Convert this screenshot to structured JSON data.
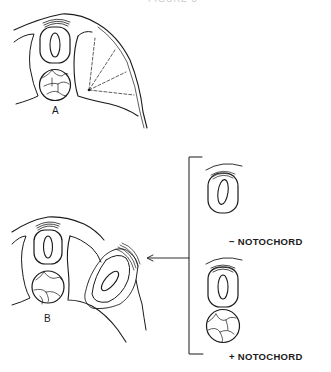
{
  "figure": {
    "title_partial": "FIGURE 3",
    "panels": [
      {
        "id": "A",
        "label": "A",
        "description": "Cross-section: neural tube above notochord, with somite region showing dashed radial lines fanning from a point"
      },
      {
        "id": "B",
        "label": "B",
        "description": "Cross-section: neural tube above notochord, with grafted tissue (neural tube + notochord explant) implanted laterally, dotted outline"
      }
    ],
    "legend": {
      "minus_label": "− NOTOCHORD",
      "plus_label": "+ NOTOCHORD",
      "minus_symbol": "−",
      "plus_symbol": "+",
      "text": "NOTOCHORD"
    },
    "arrow": {
      "direction": "left",
      "meaning": "graft source to panel B"
    }
  },
  "colors": {
    "ink": "#1a1a1a",
    "background": "#ffffff",
    "faint": "#c8c8c8"
  }
}
